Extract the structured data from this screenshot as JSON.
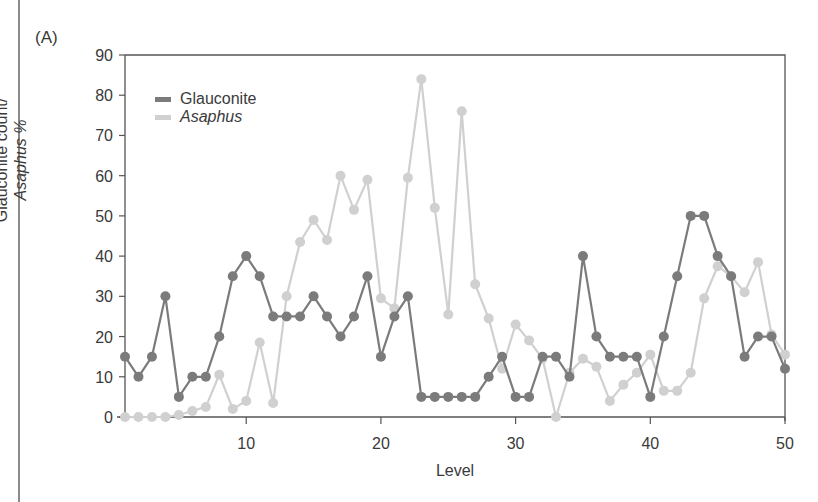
{
  "panel_label": "(A)",
  "colors": {
    "glauconite": "#7b7b7b",
    "asaphus": "#d0d0d0",
    "axis": "#555555"
  },
  "chart_data": {
    "type": "line",
    "title": "",
    "panel": "(A)",
    "xlabel": "Level",
    "ylabel_line1": "Glauconite count/",
    "ylabel_line2": "Asaphus %",
    "xlim": [
      1,
      50
    ],
    "ylim": [
      0,
      90
    ],
    "xticks": [
      10,
      20,
      30,
      40,
      50
    ],
    "yticks": [
      0,
      10,
      20,
      30,
      40,
      50,
      60,
      70,
      80,
      90
    ],
    "grid": false,
    "legend_position": "upper-left",
    "x": [
      1,
      2,
      3,
      4,
      5,
      6,
      7,
      8,
      9,
      10,
      11,
      12,
      13,
      14,
      15,
      16,
      17,
      18,
      19,
      20,
      21,
      22,
      23,
      24,
      25,
      26,
      27,
      28,
      29,
      30,
      31,
      32,
      33,
      34,
      35,
      36,
      37,
      38,
      39,
      40,
      41,
      42,
      43,
      44,
      45,
      46,
      47,
      48,
      49,
      50
    ],
    "series": [
      {
        "name": "Glauconite",
        "italic": false,
        "values": [
          15,
          10,
          15,
          30,
          5,
          10,
          10,
          20,
          35,
          40,
          35,
          25,
          25,
          25,
          30,
          25,
          20,
          25,
          35,
          15,
          25,
          30,
          5,
          5,
          5,
          5,
          5,
          10,
          15,
          5,
          5,
          15,
          15,
          10,
          40,
          20,
          15,
          15,
          15,
          5,
          20,
          35,
          50,
          50,
          40,
          35,
          15,
          20,
          20,
          12
        ]
      },
      {
        "name": "Asaphus",
        "italic": true,
        "values": [
          0,
          0,
          0,
          0,
          0.5,
          1.5,
          2.5,
          10.5,
          2,
          4,
          18.5,
          3.5,
          30,
          43.5,
          49,
          44,
          60,
          51.5,
          59,
          29.5,
          27,
          59.5,
          84,
          52,
          25.5,
          76,
          33,
          24.5,
          12,
          23,
          19,
          14.5,
          0,
          11,
          14.5,
          12.5,
          4,
          8,
          11,
          15.5,
          6.5,
          6.5,
          11,
          29.5,
          37.5,
          35,
          31,
          38.5,
          20.5,
          15.5
        ]
      }
    ]
  }
}
